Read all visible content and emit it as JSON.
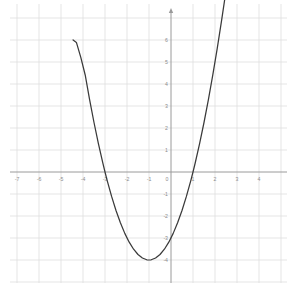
{
  "chart_data": {
    "type": "line",
    "title": "",
    "subtitle": "",
    "xlabel": "",
    "ylabel": "",
    "grid": true,
    "legend": false,
    "legend_position": "none",
    "function": "y = x^2 + 2x - 3",
    "curve_color": "#3a3a3a",
    "axis_color": "#9a9a9a",
    "grid_color": "#dedede",
    "grid_minor_color": "#eeeeee",
    "label_color": "#8c8c8c",
    "background_color": "#ffffff",
    "xlim": [
      -7.6,
      4.9
    ],
    "ylim": [
      -4.9,
      6.5
    ],
    "x_ticks": [
      -7,
      -6,
      -5,
      -4,
      -3,
      -2,
      -1,
      0,
      1,
      2,
      3,
      4
    ],
    "y_ticks": [
      6,
      5,
      4,
      3,
      2,
      1,
      0,
      -1,
      -2,
      -3,
      -4
    ],
    "x_tick_labels": [
      "-7",
      "-6",
      "-5",
      "-4",
      "-3",
      "-2",
      "-1",
      "0",
      "1",
      "2",
      "3",
      "4"
    ],
    "y_tick_labels": [
      "6",
      "5",
      "4",
      "3",
      "2",
      "1",
      "0",
      "-1",
      "-2",
      "-3",
      "-4"
    ],
    "vertex": [
      -1,
      -4
    ],
    "x_intercepts": [
      -3,
      1
    ],
    "y_intercept": -3,
    "x": [
      -4.45,
      -4.3,
      -4.1,
      -3.9,
      -3.7,
      -3.5,
      -3.3,
      -3.1,
      -3.0,
      -2.9,
      -2.7,
      -2.5,
      -2.3,
      -2.1,
      -1.9,
      -1.7,
      -1.5,
      -1.3,
      -1.1,
      -1.0,
      -0.9,
      -0.7,
      -0.5,
      -0.3,
      -0.1,
      0.1,
      0.3,
      0.5,
      0.7,
      0.9,
      1.0,
      1.1,
      1.3,
      1.5,
      1.7,
      1.9,
      2.1,
      2.3,
      2.45
    ],
    "y": [
      6.0025,
      5.89,
      5.21,
      4.41,
      3.29,
      2.25,
      1.29,
      0.41,
      0.0,
      -0.39,
      -1.11,
      -1.75,
      -2.31,
      -2.79,
      -3.19,
      -3.51,
      -3.75,
      -3.91,
      -3.99,
      -4.0,
      -3.99,
      -3.91,
      -3.75,
      -3.51,
      -3.19,
      -2.79,
      -2.31,
      -1.75,
      -1.11,
      -0.39,
      0.0,
      0.41,
      1.29,
      2.25,
      3.29,
      4.41,
      5.61,
      6.89,
      7.9
    ]
  },
  "grid": {
    "minor_spacing_px": 22,
    "origin_px": [
      171,
      172
    ]
  }
}
